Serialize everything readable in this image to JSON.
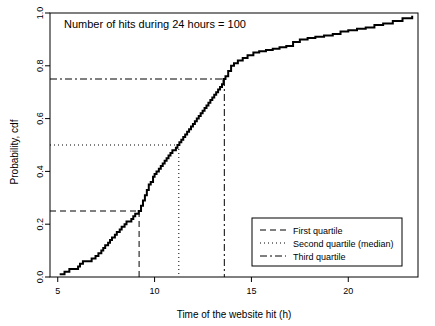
{
  "chart_data": {
    "type": "line",
    "title": "Number of hits during 24 hours = 100",
    "xlabel": "Time of the website hit (h)",
    "ylabel": "Probability, cdf",
    "xlim": [
      4.6,
      23.6
    ],
    "ylim": [
      0.0,
      1.0
    ],
    "xticks": [
      5,
      10,
      15,
      20
    ],
    "xtick_labels": [
      "5",
      "10",
      "15",
      "20"
    ],
    "yticks": [
      0.0,
      0.2,
      0.4,
      0.6,
      0.8,
      1.0
    ],
    "ytick_labels": [
      "0.0",
      "0.2",
      "0.4",
      "0.6",
      "0.8",
      "1.0"
    ],
    "grid": false,
    "legend_position": "bottom-right",
    "series": [
      {
        "name": "Empirical cdf",
        "style": "step",
        "color": "#000000",
        "x": [
          5.1,
          5.35,
          5.6,
          6.05,
          6.15,
          6.3,
          6.55,
          6.75,
          6.95,
          7.1,
          7.25,
          7.35,
          7.45,
          7.6,
          7.7,
          7.8,
          7.95,
          8.05,
          8.2,
          8.3,
          8.45,
          8.55,
          8.7,
          8.8,
          8.9,
          9.0,
          9.1,
          9.18,
          9.3,
          9.4,
          9.5,
          9.6,
          9.7,
          9.8,
          9.92,
          10.0,
          10.1,
          10.22,
          10.32,
          10.42,
          10.52,
          10.62,
          10.72,
          10.82,
          10.92,
          11.0,
          11.1,
          11.18,
          11.28,
          11.38,
          11.48,
          11.58,
          11.68,
          11.78,
          11.88,
          11.98,
          12.08,
          12.18,
          12.28,
          12.38,
          12.48,
          12.58,
          12.68,
          12.78,
          12.88,
          12.98,
          13.08,
          13.18,
          13.28,
          13.38,
          13.48,
          13.56,
          13.66,
          13.8,
          13.95,
          14.1,
          14.3,
          14.55,
          14.8,
          15.1,
          15.4,
          15.75,
          16.1,
          16.45,
          16.8,
          17.15,
          17.5,
          17.9,
          18.3,
          18.75,
          19.2,
          19.6,
          20.0,
          20.45,
          20.9,
          21.35,
          21.8,
          22.3,
          22.8,
          23.3
        ],
        "y": [
          0.01,
          0.02,
          0.03,
          0.04,
          0.05,
          0.06,
          0.06,
          0.07,
          0.08,
          0.09,
          0.1,
          0.11,
          0.12,
          0.13,
          0.14,
          0.15,
          0.16,
          0.17,
          0.18,
          0.19,
          0.2,
          0.21,
          0.21,
          0.22,
          0.23,
          0.24,
          0.24,
          0.25,
          0.27,
          0.29,
          0.31,
          0.33,
          0.35,
          0.36,
          0.38,
          0.39,
          0.4,
          0.41,
          0.42,
          0.43,
          0.44,
          0.45,
          0.46,
          0.47,
          0.48,
          0.48,
          0.49,
          0.5,
          0.51,
          0.52,
          0.53,
          0.54,
          0.55,
          0.56,
          0.57,
          0.58,
          0.59,
          0.6,
          0.61,
          0.62,
          0.63,
          0.64,
          0.65,
          0.66,
          0.67,
          0.68,
          0.69,
          0.7,
          0.71,
          0.72,
          0.73,
          0.75,
          0.76,
          0.78,
          0.8,
          0.81,
          0.82,
          0.83,
          0.84,
          0.85,
          0.855,
          0.86,
          0.865,
          0.87,
          0.875,
          0.89,
          0.9,
          0.905,
          0.91,
          0.915,
          0.92,
          0.93,
          0.935,
          0.94,
          0.945,
          0.955,
          0.96,
          0.97,
          0.98,
          0.99
        ]
      }
    ],
    "annotations": [
      {
        "name": "first-quartile",
        "label": "First quartile",
        "line_style": "dashed",
        "probability": 0.25,
        "time": 9.2,
        "color": "#000000"
      },
      {
        "name": "second-quartile",
        "label": "Second quartile (median)",
        "line_style": "dotted",
        "probability": 0.5,
        "time": 11.25,
        "color": "#000000"
      },
      {
        "name": "third-quartile",
        "label": "Third quartile",
        "line_style": "dashdot",
        "probability": 0.75,
        "time": 13.6,
        "color": "#000000"
      }
    ],
    "legend": [
      {
        "label": "First quartile",
        "style": "dashed"
      },
      {
        "label": "Second quartile (median)",
        "style": "dotted"
      },
      {
        "label": "Third quartile",
        "style": "dashdot"
      }
    ]
  },
  "axes": {
    "x_title": "Time of the website hit (h)",
    "y_title": "Probability, cdf",
    "x_tick_labels": [
      "5",
      "10",
      "15",
      "20"
    ],
    "y_tick_labels": [
      "0.0",
      "0.2",
      "0.4",
      "0.6",
      "0.8",
      "1.0"
    ]
  },
  "title": "Number of hits during 24 hours = 100",
  "legend": {
    "item_0": "First quartile",
    "item_1": "Second quartile (median)",
    "item_2": "Third quartile"
  },
  "colors": {
    "curve": "#000000",
    "frame": "#000000",
    "background": "#ffffff"
  }
}
